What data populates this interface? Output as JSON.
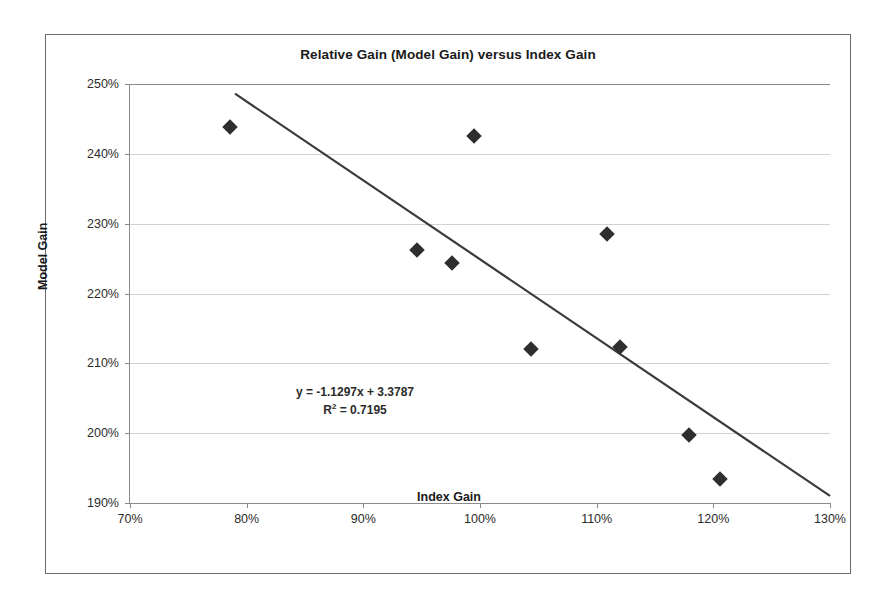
{
  "chart_data": {
    "type": "scatter",
    "title": "Relative Gain (Model Gain) versus Index Gain",
    "xlabel": "Index Gain",
    "ylabel": "Model Gain",
    "xlim": [
      70,
      130
    ],
    "ylim": [
      190,
      250
    ],
    "xticks": [
      "70%",
      "80%",
      "90%",
      "100%",
      "110%",
      "120%",
      "130%"
    ],
    "yticks": [
      "190%",
      "200%",
      "210%",
      "220%",
      "230%",
      "240%",
      "250%"
    ],
    "xtick_values": [
      70,
      80,
      90,
      100,
      110,
      120,
      130
    ],
    "ytick_values": [
      190,
      200,
      210,
      220,
      230,
      240,
      250
    ],
    "grid": "horizontal",
    "legend": "none",
    "marker_style": "filled-diamond",
    "marker_color": "#2e2e2e",
    "points": [
      {
        "x": 78.6,
        "y": 243.9
      },
      {
        "x": 94.6,
        "y": 226.3
      },
      {
        "x": 97.6,
        "y": 224.3
      },
      {
        "x": 99.5,
        "y": 242.5
      },
      {
        "x": 104.4,
        "y": 212.1
      },
      {
        "x": 110.9,
        "y": 228.5
      },
      {
        "x": 112.0,
        "y": 212.4
      },
      {
        "x": 117.9,
        "y": 199.8
      },
      {
        "x": 120.6,
        "y": 193.5
      }
    ],
    "trendline": {
      "type": "linear",
      "slope": -1.1297,
      "intercept": 3.3787,
      "r_squared": 0.7195,
      "color": "#3a3a3a",
      "equation_text": "y = -1.1297x + 3.3787",
      "r2_label": "R",
      "r2_exponent": "2",
      "r2_value": " = 0.7195",
      "x_start": 79.0,
      "x_end": 130.0
    }
  }
}
